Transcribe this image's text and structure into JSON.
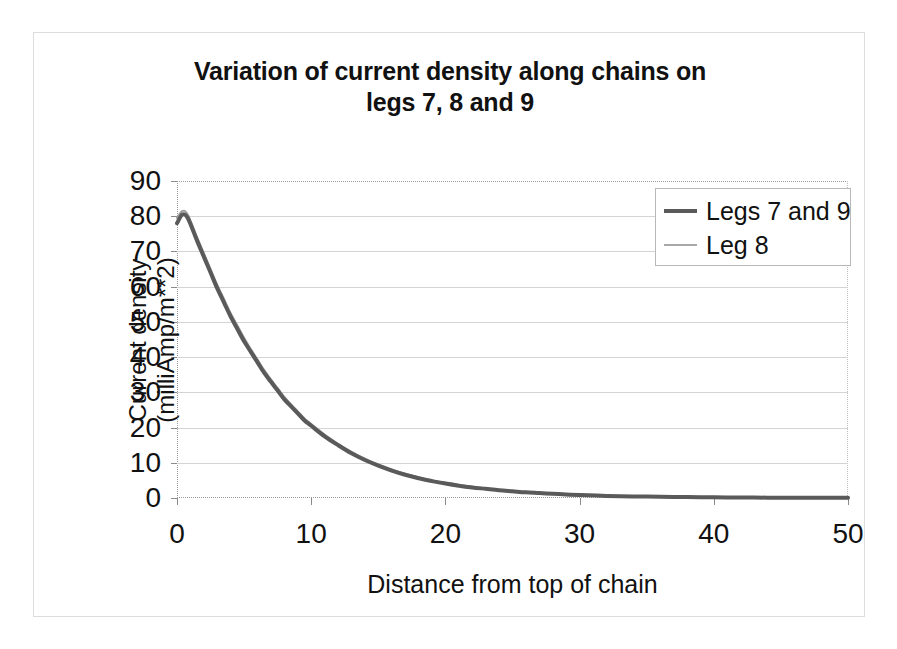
{
  "chart_data": {
    "type": "line",
    "title": "Variation of current density along chains on\nlegs 7, 8 and 9",
    "xlabel": "Distance from top of chain",
    "ylabel": "Current density\n(milliAmp/m**2)",
    "xlim": [
      0,
      50
    ],
    "ylim": [
      0,
      90
    ],
    "xticks": [
      0,
      10,
      20,
      30,
      40,
      50
    ],
    "yticks": [
      0,
      10,
      20,
      30,
      40,
      50,
      60,
      70,
      80,
      90
    ],
    "xtick_labels": [
      "0",
      "10",
      "20",
      "30",
      "40",
      "50"
    ],
    "ytick_labels": [
      "0",
      "10",
      "20",
      "30",
      "40",
      "50",
      "60",
      "70",
      "80",
      "90"
    ],
    "grid": "horizontal",
    "legend_position": "top-right",
    "series": [
      {
        "name": "Legs 7 and 9",
        "color": "#5a5a5a",
        "width": 4,
        "x": [
          0,
          0.4,
          0.8,
          1.5,
          2,
          2.5,
          3,
          3.5,
          4,
          4.5,
          5,
          5.5,
          6,
          6.5,
          7,
          7.5,
          8,
          8.5,
          9,
          9.5,
          10,
          11,
          12,
          13,
          14,
          15,
          16,
          17,
          18,
          19,
          20,
          21,
          22,
          23,
          24,
          25,
          26,
          27,
          28,
          29,
          30,
          32,
          34,
          36,
          38,
          40,
          42,
          44,
          46,
          48,
          50
        ],
        "y": [
          78,
          80.5,
          79.5,
          73,
          68.5,
          64,
          59.5,
          55.5,
          51.5,
          48,
          44.5,
          41.5,
          38.5,
          35.5,
          33,
          30.5,
          28,
          26,
          24,
          22,
          20.5,
          17.5,
          15,
          12.7,
          10.8,
          9.2,
          7.8,
          6.6,
          5.6,
          4.8,
          4.1,
          3.5,
          3,
          2.6,
          2.2,
          1.9,
          1.6,
          1.4,
          1.2,
          1,
          0.85,
          0.6,
          0.45,
          0.35,
          0.25,
          0.2,
          0.15,
          0.1,
          0.08,
          0.05,
          0.04
        ]
      },
      {
        "name": "Leg 8",
        "color": "#a0a0a0",
        "width": 2,
        "x": [
          0,
          0.4,
          0.8,
          1.5,
          2,
          2.5,
          3,
          3.5,
          4,
          4.5,
          5,
          5.5,
          6,
          6.5,
          7,
          7.5,
          8,
          8.5,
          9,
          9.5,
          10,
          11,
          12,
          13,
          14,
          15,
          16,
          17,
          18,
          19,
          20,
          21,
          22,
          23,
          24,
          25,
          26,
          27,
          28,
          29,
          30,
          32,
          34,
          36,
          38,
          40,
          42,
          44,
          46,
          48,
          50
        ],
        "y": [
          79.5,
          81.5,
          80.5,
          74,
          69.5,
          65,
          60.5,
          56.5,
          52.5,
          49,
          45.5,
          42.3,
          39.3,
          36.3,
          33.7,
          31.2,
          28.7,
          26.6,
          24.6,
          22.6,
          21,
          18,
          15.4,
          13.1,
          11.2,
          9.5,
          8.1,
          6.9,
          5.9,
          5,
          4.3,
          3.7,
          3.2,
          2.7,
          2.3,
          2,
          1.7,
          1.5,
          1.3,
          1.1,
          0.95,
          0.7,
          0.5,
          0.4,
          0.3,
          0.22,
          0.17,
          0.12,
          0.09,
          0.06,
          0.05
        ]
      }
    ]
  },
  "legend": {
    "entries": [
      {
        "label": "Legs 7 and 9"
      },
      {
        "label": "Leg 8"
      }
    ]
  }
}
